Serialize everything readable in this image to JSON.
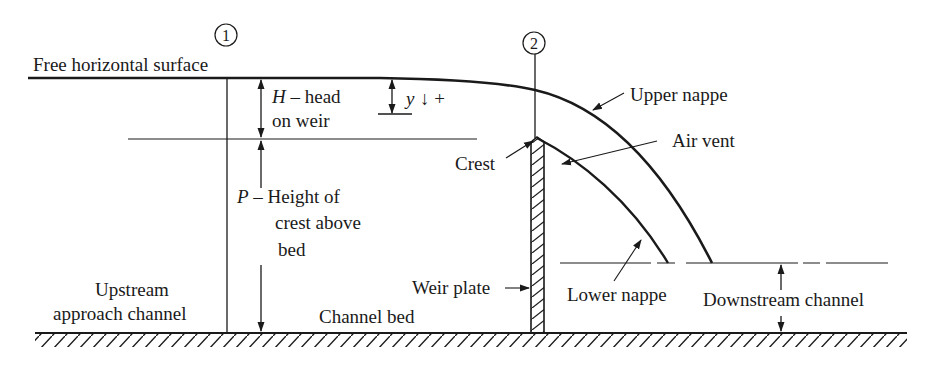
{
  "diagram": {
    "sections": [
      {
        "id": "section-1",
        "label": "1"
      },
      {
        "id": "section-2",
        "label": "2"
      }
    ],
    "labels": {
      "free_surface": "Free horizontal surface",
      "head_symbol": "H",
      "head_line1": " – head",
      "head_line2": "on weir",
      "y_symbol": "y",
      "y_direction": "↓ +",
      "crest": "Crest",
      "upper_nappe": "Upper nappe",
      "air_vent": "Air vent",
      "p_symbol": "P",
      "p_line1": " – Height of",
      "p_line2": "crest above",
      "p_line3": "bed",
      "upstream_line1": "Upstream",
      "upstream_line2": "approach channel",
      "channel_bed": "Channel bed",
      "weir_plate": "Weir plate",
      "lower_nappe": "Lower nappe",
      "downstream": "Downstream channel"
    },
    "colors": {
      "ink": "#1a1a1a",
      "background": "#ffffff"
    }
  }
}
